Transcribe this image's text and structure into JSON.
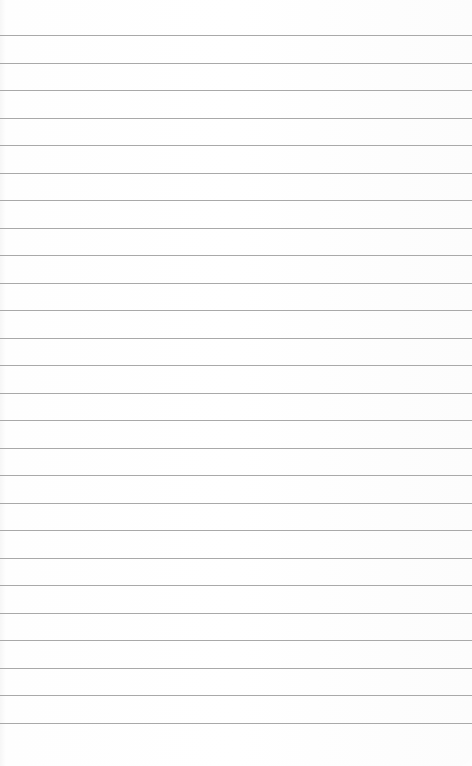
{
  "paper": {
    "type": "lined-paper",
    "line_color": "#a9a9a9",
    "background_color": "#ffffff",
    "first_line_y": 35,
    "line_spacing": 27.5,
    "line_count": 26
  }
}
